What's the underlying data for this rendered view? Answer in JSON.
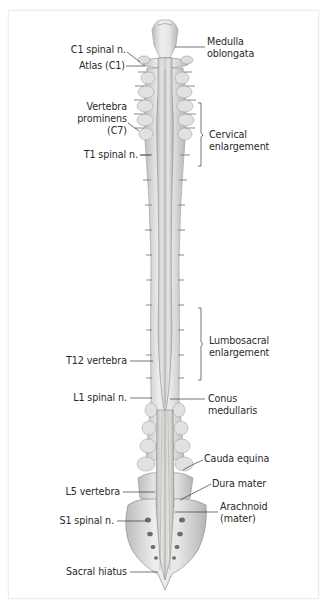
{
  "figure": {
    "labels_left": {
      "c1_spinal_n": "C1 spinal n.",
      "atlas": "Atlas (C1)",
      "vertebra_prominens_1": "Vertebra",
      "vertebra_prominens_2": "prominens",
      "vertebra_prominens_3": "(C7)",
      "t1_spinal_n": "T1 spinal n.",
      "t12_vertebra": "T12 vertebra",
      "l1_spinal_n": "L1 spinal n.",
      "l5_vertebra": "L5 vertebra",
      "s1_spinal_n": "S1 spinal n.",
      "sacral_hiatus": "Sacral hiatus"
    },
    "labels_right": {
      "medulla_1": "Medulla",
      "medulla_2": "oblongata",
      "cervical_1": "Cervical",
      "cervical_2": "enlargement",
      "lumbosacral_1": "Lumbosacral",
      "lumbosacral_2": "enlargement",
      "conus_1": "Conus",
      "conus_2": "medullaris",
      "cauda_equina": "Cauda equina",
      "dura_mater": "Dura mater",
      "arachnoid_1": "Arachnoid",
      "arachnoid_2": "(mater)"
    },
    "colors": {
      "bone": "#e4e3e1",
      "bone_shadow": "#a9a8a6",
      "cord": "#d6d5d3",
      "line": "#3a3a3a",
      "text": "#2a2a2a"
    }
  }
}
